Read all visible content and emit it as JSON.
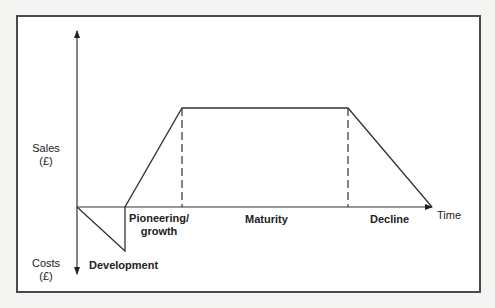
{
  "diagram": {
    "type": "product-life-cycle",
    "y_axis": {
      "positive_label": "Sales",
      "positive_unit": "(£)",
      "negative_label": "Costs",
      "negative_unit": "(£)"
    },
    "x_axis": {
      "label": "Time"
    },
    "stages": [
      {
        "name": "Development"
      },
      {
        "name": "Pioneering/",
        "name_line2": "growth"
      },
      {
        "name": "Maturity"
      },
      {
        "name": "Decline"
      }
    ],
    "curve_points": [
      [
        77,
        207
      ],
      [
        125,
        251
      ],
      [
        125,
        207
      ],
      [
        182,
        108
      ],
      [
        348,
        108
      ],
      [
        432,
        207
      ]
    ],
    "dashed_dividers_x": [
      182,
      348
    ],
    "colors": {
      "line": "#333333",
      "frame": "#4a4a4a",
      "text": "#222222",
      "background": "#ffffff"
    }
  }
}
